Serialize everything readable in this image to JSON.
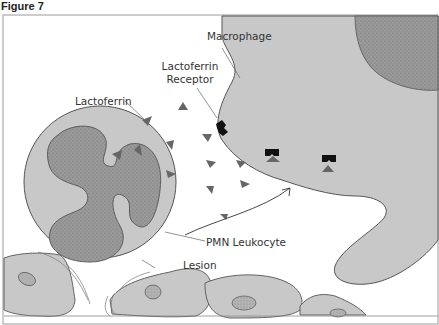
{
  "figure": {
    "title": "Figure 7"
  },
  "labels": {
    "macrophage": "Macrophage",
    "receptor_line1": "Lactoferrin",
    "receptor_line2": "Receptor",
    "lactoferrin": "Lactoferrin",
    "pmn": "PMN Leukocyte",
    "lesion": "Lesion"
  },
  "colors": {
    "cell_fill": "#c8c8c8",
    "nucleus_fill": "#999999",
    "outline": "#555555",
    "triangle": "#666666",
    "receptor": "#111111",
    "background": "#ffffff"
  },
  "elements": {
    "cells": [
      "Macrophage",
      "PMN Leukocyte",
      "Epithelial cells"
    ],
    "molecules": "Lactoferrin (triangles)",
    "receptors_count": 3,
    "arrow": "curved arrow from PMN toward macrophage"
  }
}
